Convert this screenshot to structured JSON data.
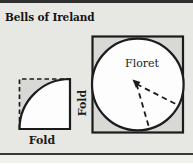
{
  "title": "Bells of Ireland",
  "labels": {
    "fold_bottom": "Fold",
    "fold_side": "Fold",
    "floret": "Floret"
  },
  "colors": {
    "background": "#e7e7e4",
    "shaded_fill": "#d8d8d5",
    "shape_fill": "#fdfdfd",
    "line": "#1c1c1c",
    "rule": "#2f2f2f",
    "footer_strip": "#f1f1ee",
    "text": "#141414"
  }
}
